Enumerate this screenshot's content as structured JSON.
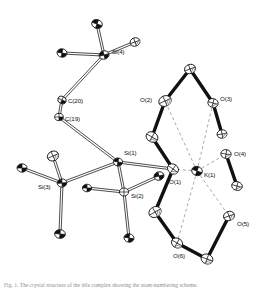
{
  "figure": {
    "kind": "ortep-thermal-ellipsoid-plot",
    "background_color": "#ffffff",
    "bond_color": "#111111",
    "contact_color": "#9a9a9a",
    "ellipsoid_fill": "#ffffff",
    "ellipsoid_outline": "#111111"
  },
  "caption": {
    "text": "Fig. 1. The crystal structure of the title complex showing the atom-numbering scheme."
  },
  "atoms": [
    {
      "id": "Si4",
      "label": "Si(4)",
      "element": "Si",
      "x": 104,
      "y": 55,
      "rx": 5.0,
      "ry": 4.2,
      "rot": -15,
      "shade": "dark",
      "label_dx": 8,
      "label_dy": -3
    },
    {
      "id": "K1",
      "label": "K(1)",
      "element": "K",
      "x": 197,
      "y": 171,
      "rx": 5.4,
      "ry": 4.6,
      "rot": 20,
      "shade": "dark",
      "label_dx": 7,
      "label_dy": 4
    },
    {
      "id": "Si1",
      "label": "Si(1)",
      "element": "Si",
      "x": 118,
      "y": 162,
      "rx": 4.6,
      "ry": 4.0,
      "rot": 10,
      "shade": "dark",
      "label_dx": 6,
      "label_dy": -9
    },
    {
      "id": "Si2",
      "label": "Si(2)",
      "element": "Si",
      "x": 124,
      "y": 192,
      "rx": 4.6,
      "ry": 4.0,
      "rot": 0,
      "shade": "light",
      "label_dx": 7,
      "label_dy": 4
    },
    {
      "id": "Si3",
      "label": "Si(3)",
      "element": "Si",
      "x": 62,
      "y": 183,
      "rx": 4.8,
      "ry": 4.1,
      "rot": -5,
      "shade": "dark",
      "label_dx": -24,
      "label_dy": 4
    },
    {
      "id": "C20",
      "label": "C(20)",
      "element": "C",
      "x": 62,
      "y": 100,
      "rx": 4.3,
      "ry": 3.6,
      "rot": 25,
      "shade": "half",
      "label_dx": 6,
      "label_dy": 1
    },
    {
      "id": "C19",
      "label": "C(19)",
      "element": "C",
      "x": 59,
      "y": 117,
      "rx": 4.3,
      "ry": 3.6,
      "rot": 0,
      "shade": "half",
      "label_dx": 6,
      "label_dy": 2
    },
    {
      "id": "O1",
      "label": "O(1)",
      "element": "O",
      "x": 173,
      "y": 169,
      "rx": 5.8,
      "ry": 4.8,
      "rot": 35,
      "shade": "hatch",
      "label_dx": -4,
      "label_dy": 13
    },
    {
      "id": "O2",
      "label": "O(2)",
      "element": "O",
      "x": 165,
      "y": 101,
      "rx": 6.4,
      "ry": 5.2,
      "rot": -25,
      "shade": "hatch",
      "label_dx": -25,
      "label_dy": -1
    },
    {
      "id": "O3",
      "label": "O(3)",
      "element": "O",
      "x": 213,
      "y": 103,
      "rx": 5.2,
      "ry": 4.4,
      "rot": 15,
      "shade": "hatch",
      "label_dx": 7,
      "label_dy": -4
    },
    {
      "id": "O4",
      "label": "O(4)",
      "element": "O",
      "x": 226,
      "y": 154,
      "rx": 5.2,
      "ry": 4.4,
      "rot": 10,
      "shade": "hatch",
      "label_dx": 8,
      "label_dy": 0
    },
    {
      "id": "O5",
      "label": "O(5)",
      "element": "O",
      "x": 229,
      "y": 216,
      "rx": 5.6,
      "ry": 4.6,
      "rot": -20,
      "shade": "hatch",
      "label_dx": 8,
      "label_dy": 8
    },
    {
      "id": "O6",
      "label": "O(6)",
      "element": "O",
      "x": 177,
      "y": 243,
      "rx": 5.8,
      "ry": 4.8,
      "rot": 30,
      "shade": "hatch",
      "label_dx": -4,
      "label_dy": 13
    }
  ],
  "unlabelled_atoms": [
    {
      "id": "Me41",
      "x": 97,
      "y": 24,
      "rx": 5.4,
      "ry": 4.4,
      "rot": 20,
      "shade": "dark"
    },
    {
      "id": "Me42",
      "x": 135,
      "y": 42,
      "rx": 5.0,
      "ry": 4.2,
      "rot": -20,
      "shade": "hatch"
    },
    {
      "id": "Me43",
      "x": 62,
      "y": 53,
      "rx": 5.0,
      "ry": 4.2,
      "rot": 10,
      "shade": "dark"
    },
    {
      "id": "Me31",
      "x": 22,
      "y": 168,
      "rx": 5.0,
      "ry": 4.2,
      "rot": 0,
      "shade": "dark"
    },
    {
      "id": "Me32",
      "x": 53,
      "y": 156,
      "rx": 5.8,
      "ry": 4.8,
      "rot": -25,
      "shade": "hatch"
    },
    {
      "id": "Me33",
      "x": 60,
      "y": 234,
      "rx": 5.4,
      "ry": 4.4,
      "rot": 5,
      "shade": "dark"
    },
    {
      "id": "Me21",
      "x": 87,
      "y": 188,
      "rx": 4.6,
      "ry": 3.8,
      "rot": 0,
      "shade": "dark"
    },
    {
      "id": "Me22",
      "x": 159,
      "y": 176,
      "rx": 5.0,
      "ry": 4.2,
      "rot": -15,
      "shade": "dark"
    },
    {
      "id": "Me23",
      "x": 129,
      "y": 238,
      "rx": 5.0,
      "ry": 4.2,
      "rot": 10,
      "shade": "dark"
    },
    {
      "id": "Cr1",
      "x": 190,
      "y": 69,
      "rx": 5.6,
      "ry": 4.6,
      "rot": -20,
      "shade": "hatch"
    },
    {
      "id": "Cr2",
      "x": 152,
      "y": 137,
      "rx": 6.2,
      "ry": 5.0,
      "rot": 30,
      "shade": "hatch"
    },
    {
      "id": "Cr3",
      "x": 155,
      "y": 212,
      "rx": 6.4,
      "ry": 5.2,
      "rot": -30,
      "shade": "hatch"
    },
    {
      "id": "Cr4",
      "x": 207,
      "y": 259,
      "rx": 6.0,
      "ry": 4.9,
      "rot": 20,
      "shade": "hatch"
    }
  ],
  "bonds": [
    {
      "from": "Si4",
      "to": "Me41",
      "style": "double-line"
    },
    {
      "from": "Si4",
      "to": "Me42",
      "style": "double-line"
    },
    {
      "from": "Si4",
      "to": "Me43",
      "style": "double-line"
    },
    {
      "from": "Si4",
      "to": "C20",
      "style": "double-line"
    },
    {
      "from": "C20",
      "to": "C19",
      "style": "double-line"
    },
    {
      "from": "C19",
      "to": "Si1",
      "style": "double-line"
    },
    {
      "from": "Si1",
      "to": "Si2",
      "style": "double-line"
    },
    {
      "from": "Si1",
      "to": "Si3",
      "style": "double-line"
    },
    {
      "from": "Si1",
      "to": "O1",
      "style": "double-line"
    },
    {
      "from": "Si3",
      "to": "Me31",
      "style": "double-line"
    },
    {
      "from": "Si3",
      "to": "Me32",
      "style": "double-line"
    },
    {
      "from": "Si3",
      "to": "Me33",
      "style": "double-line"
    },
    {
      "from": "Si2",
      "to": "Me21",
      "style": "double-line"
    },
    {
      "from": "Si2",
      "to": "Me22",
      "style": "double-line"
    },
    {
      "from": "Si2",
      "to": "Me23",
      "style": "double-line"
    },
    {
      "from": "O2",
      "to": "Cr1",
      "style": "thick"
    },
    {
      "from": "Cr1",
      "to": "O3",
      "style": "thick"
    },
    {
      "from": "O3",
      "to": "Cr5",
      "style": "thick"
    },
    {
      "from": "O4",
      "to": "Cr6",
      "style": "thick"
    },
    {
      "from": "O5",
      "to": "Cr4",
      "style": "thick"
    },
    {
      "from": "Cr4",
      "to": "O6",
      "style": "thick"
    },
    {
      "from": "O6",
      "to": "Cr3",
      "style": "thick"
    },
    {
      "from": "Cr3",
      "to": "O1",
      "style": "thick"
    },
    {
      "from": "O1",
      "to": "Cr2",
      "style": "thick"
    },
    {
      "from": "Cr2",
      "to": "O2",
      "style": "thick"
    }
  ],
  "coordination_contacts": [
    {
      "from": "K1",
      "to": "O1",
      "style": "dashed"
    },
    {
      "from": "K1",
      "to": "O2",
      "style": "dashed"
    },
    {
      "from": "K1",
      "to": "O3",
      "style": "dashed"
    },
    {
      "from": "K1",
      "to": "O4",
      "style": "dashed"
    },
    {
      "from": "K1",
      "to": "O5",
      "style": "dashed"
    },
    {
      "from": "K1",
      "to": "O6",
      "style": "dashed"
    }
  ]
}
